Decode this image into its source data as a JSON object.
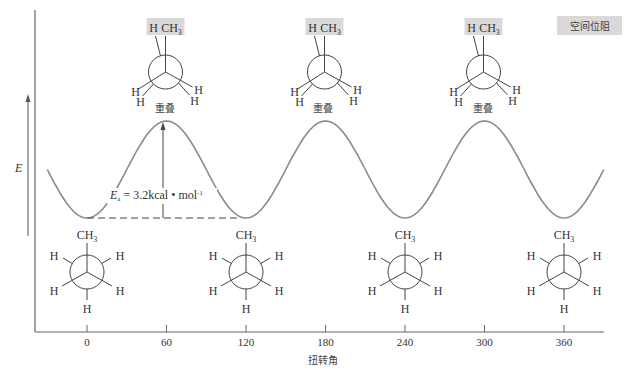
{
  "diagram": {
    "title": "",
    "y_axis_label": "E",
    "x_axis_label": "扭转角",
    "x_ticks": [
      "0",
      "60",
      "120",
      "180",
      "240",
      "300",
      "360"
    ],
    "steric_box_label": "空间位阻",
    "eclipsed_label": "重叠",
    "barrier_label": {
      "symbol": "E",
      "subscript": "a",
      "text": " = 3.2kcal • mol",
      "superscript": "-1"
    },
    "colors": {
      "curve": "#8a8a8a",
      "axis": "#555555",
      "highlight": "#d9d9d9",
      "text": "#333333"
    }
  },
  "chart_data": {
    "type": "line",
    "title": "",
    "xlabel": "扭转角",
    "ylabel": "E",
    "x_range": [
      -30,
      390
    ],
    "y_range": [
      0,
      3.2
    ],
    "series": [
      {
        "name": "torsional energy",
        "x": [
          -30,
          0,
          60,
          120,
          180,
          240,
          300,
          360,
          390
        ],
        "y": [
          1.6,
          0,
          3.2,
          0,
          3.2,
          0,
          3.2,
          0,
          1.6
        ]
      }
    ],
    "annotations": [
      {
        "x": 60,
        "text": "重叠"
      },
      {
        "x": 180,
        "text": "重叠"
      },
      {
        "x": 300,
        "text": "重叠"
      },
      {
        "x": 60,
        "text": "Ea = 3.2kcal • mol-1"
      }
    ]
  },
  "conformers": {
    "eclipsed": [
      {
        "angle": "60",
        "top_labels": [
          "H",
          "CH3"
        ],
        "front_left": "H",
        "front_left2": "H",
        "front_right": "H",
        "front_right2": "H"
      },
      {
        "angle": "180",
        "top_labels": [
          "H",
          "CH3"
        ],
        "front_left": "H",
        "front_left2": "H",
        "front_right": "H",
        "front_right2": "H"
      },
      {
        "angle": "300",
        "top_labels": [
          "H",
          "CH3"
        ],
        "front_left": "H",
        "front_left2": "H",
        "front_right": "H",
        "front_right2": "H"
      }
    ],
    "staggered": [
      {
        "angle": "0",
        "top": "CH3",
        "bottom": "H",
        "ul": "H",
        "ur": "H",
        "ll": "H",
        "lr": "H"
      },
      {
        "angle": "120",
        "top": "CH3",
        "bottom": "H",
        "ul": "H",
        "ur": "H",
        "ll": "H",
        "lr": "H"
      },
      {
        "angle": "240",
        "top": "CH3",
        "bottom": "H",
        "ul": "H",
        "ur": "H",
        "ll": "H",
        "lr": "H"
      },
      {
        "angle": "360",
        "top": "CH3",
        "bottom": "H",
        "ul": "H",
        "ur": "H",
        "ll": "H",
        "lr": "H"
      }
    ]
  }
}
